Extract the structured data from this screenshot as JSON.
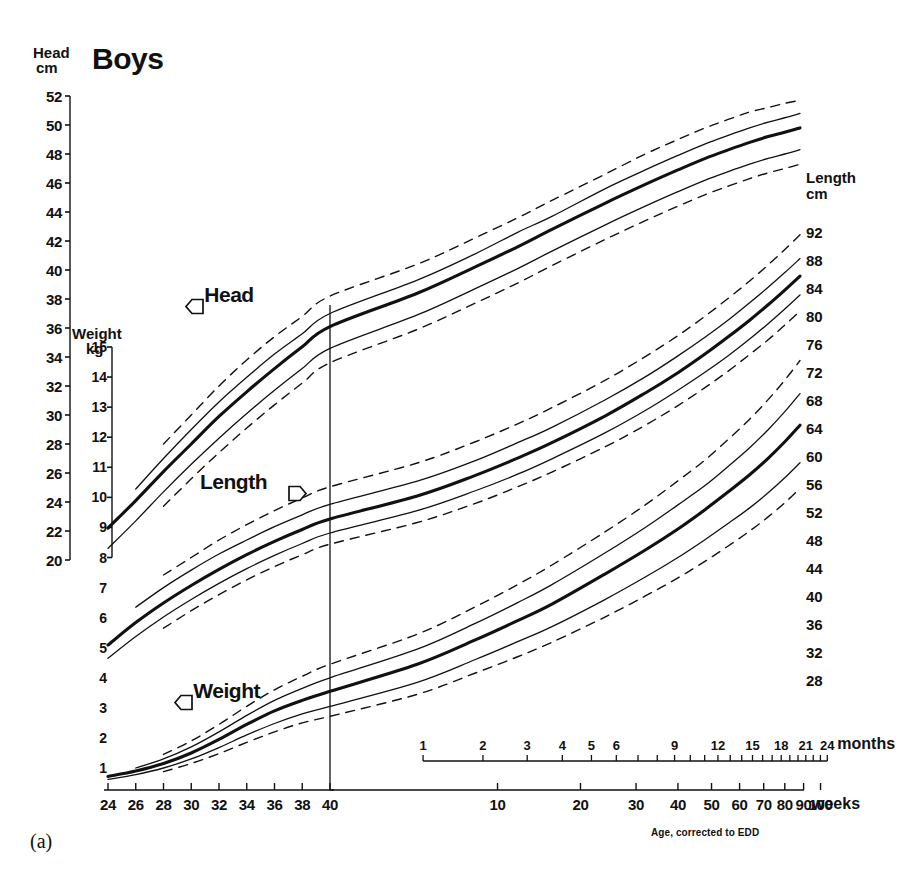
{
  "title": "Boys",
  "figure_caption": "(a)",
  "footnote": "Age, corrected to EDD",
  "axes": {
    "head": {
      "caption_line1": "Head",
      "caption_line2": "cm",
      "ticks": [
        52,
        50,
        48,
        46,
        44,
        42,
        40,
        38,
        36,
        34,
        32,
        30,
        28,
        26,
        24,
        22,
        20
      ]
    },
    "weight": {
      "caption_line1": "Weight",
      "caption_line2": "kg",
      "ticks": [
        15,
        14,
        13,
        12,
        11,
        10,
        9,
        8,
        7,
        6,
        5,
        4,
        3,
        2,
        1
      ]
    },
    "length": {
      "caption_line1": "Length",
      "caption_line2": "cm",
      "ticks": [
        92,
        88,
        84,
        80,
        76,
        72,
        68,
        64,
        60,
        56,
        52,
        48,
        44,
        40,
        36,
        32,
        28
      ]
    },
    "weeks": {
      "unit": "weeks",
      "pre_term": [
        24,
        26,
        28,
        30,
        32,
        34,
        36,
        38,
        40
      ],
      "post_term": [
        10,
        20,
        30,
        40,
        50,
        60,
        70,
        80,
        90,
        100
      ]
    },
    "months": {
      "unit": "months",
      "labeled": [
        1,
        2,
        3,
        4,
        5,
        6,
        9,
        12,
        15,
        18,
        21,
        24
      ]
    }
  },
  "curve_labels": {
    "head": "Head",
    "length": "Length",
    "weight": "Weight"
  },
  "colors": {
    "ink": "#111111",
    "paper": "#ffffff"
  },
  "chart_data": {
    "type": "line",
    "title": "Boys",
    "xlabel": "Age, corrected to EDD",
    "ylabel": "Head cm / Weight kg / Length cm",
    "grid": false,
    "legend": "inline-labels",
    "x_weeks_preterm": [
      24,
      26,
      28,
      30,
      32,
      34,
      36,
      38,
      40
    ],
    "x_weeks_postterm": [
      10,
      20,
      30,
      40,
      50,
      60,
      70,
      80,
      90,
      100
    ],
    "x_months": [
      1,
      2,
      3,
      4,
      5,
      6,
      9,
      12,
      15,
      18,
      21,
      24
    ],
    "edd_marker_weeks": 40,
    "series": [
      {
        "name": "Head circumference 97th centile",
        "unit": "cm",
        "style": "dashed",
        "x_weeks": [
          28,
          30,
          32,
          34,
          36,
          38,
          40,
          44,
          48,
          52,
          56,
          64,
          72,
          80,
          88,
          96,
          104,
          112,
          120,
          128
        ],
        "values": [
          28.0,
          30.0,
          32.0,
          33.8,
          35.4,
          36.8,
          38.2,
          40.4,
          42.2,
          43.6,
          44.8,
          46.6,
          48.0,
          49.0,
          49.8,
          50.4,
          50.9,
          51.2,
          51.5,
          51.7
        ]
      },
      {
        "name": "Head circumference 90th centile",
        "unit": "cm",
        "style": "thin-solid",
        "x_weeks": [
          26,
          28,
          30,
          32,
          34,
          36,
          38,
          40,
          44,
          48,
          52,
          56,
          64,
          72,
          80,
          88,
          96,
          104,
          112,
          120,
          128
        ],
        "values": [
          24.9,
          27.0,
          29.0,
          30.9,
          32.6,
          34.2,
          35.6,
          37.0,
          39.3,
          41.1,
          42.6,
          43.7,
          45.6,
          46.9,
          47.9,
          48.7,
          49.3,
          49.8,
          50.2,
          50.5,
          50.8
        ]
      },
      {
        "name": "Head circumference 50th centile",
        "unit": "cm",
        "style": "thick-solid",
        "x_weeks": [
          24,
          26,
          28,
          30,
          32,
          34,
          36,
          38,
          40,
          44,
          48,
          52,
          56,
          64,
          72,
          80,
          88,
          96,
          104,
          112,
          120,
          128
        ],
        "values": [
          22.2,
          24.1,
          26.1,
          28.0,
          29.9,
          31.6,
          33.2,
          34.7,
          36.1,
          38.4,
          40.2,
          41.6,
          42.8,
          44.6,
          45.9,
          46.9,
          47.7,
          48.3,
          48.8,
          49.2,
          49.5,
          49.8
        ]
      },
      {
        "name": "Head circumference 10th centile",
        "unit": "cm",
        "style": "thin-solid",
        "x_weeks": [
          24,
          26,
          28,
          30,
          32,
          34,
          36,
          38,
          40,
          44,
          48,
          52,
          56,
          64,
          72,
          80,
          88,
          96,
          104,
          112,
          120,
          128
        ],
        "values": [
          20.8,
          22.7,
          24.7,
          26.6,
          28.4,
          30.1,
          31.7,
          33.2,
          34.6,
          36.9,
          38.7,
          40.1,
          41.3,
          43.1,
          44.4,
          45.4,
          46.2,
          46.8,
          47.3,
          47.7,
          48.0,
          48.3
        ]
      },
      {
        "name": "Head circumference 3rd centile",
        "unit": "cm",
        "style": "dashed",
        "x_weeks": [
          28,
          30,
          32,
          34,
          36,
          38,
          40,
          44,
          48,
          52,
          56,
          64,
          72,
          80,
          88,
          96,
          104,
          112,
          120,
          128
        ],
        "values": [
          23.7,
          25.6,
          27.4,
          29.1,
          30.7,
          32.2,
          33.6,
          35.9,
          37.7,
          39.1,
          40.3,
          42.1,
          43.4,
          44.4,
          45.2,
          45.8,
          46.3,
          46.7,
          47.0,
          47.3
        ]
      },
      {
        "name": "Length 97th centile",
        "unit": "cm",
        "style": "dashed",
        "x_weeks": [
          28,
          30,
          32,
          34,
          36,
          38,
          40,
          44,
          48,
          52,
          56,
          64,
          72,
          80,
          88,
          96,
          104,
          112,
          120,
          128
        ],
        "values": [
          43.0,
          45.5,
          48.0,
          50.2,
          52.2,
          54.0,
          55.6,
          59.0,
          62.0,
          64.6,
          66.9,
          70.8,
          74.2,
          77.2,
          80.0,
          82.6,
          85.0,
          87.3,
          89.5,
          91.6
        ]
      },
      {
        "name": "Length 90th centile",
        "unit": "cm",
        "style": "thin-solid",
        "x_weeks": [
          26,
          28,
          30,
          32,
          34,
          36,
          38,
          40,
          44,
          48,
          52,
          56,
          64,
          72,
          80,
          88,
          96,
          104,
          112,
          120,
          128
        ],
        "values": [
          38.4,
          41.2,
          43.7,
          46.0,
          48.0,
          49.9,
          51.6,
          53.1,
          56.4,
          59.3,
          61.9,
          64.1,
          68.0,
          71.3,
          74.3,
          77.0,
          79.5,
          81.9,
          84.1,
          86.2,
          88.2
        ]
      },
      {
        "name": "Length 50th centile",
        "unit": "cm",
        "style": "thick-solid",
        "x_weeks": [
          24,
          26,
          28,
          30,
          32,
          34,
          36,
          38,
          40,
          44,
          48,
          52,
          56,
          64,
          72,
          80,
          88,
          96,
          104,
          112,
          120,
          128
        ],
        "values": [
          33.0,
          36.2,
          39.0,
          41.5,
          43.8,
          45.9,
          47.8,
          49.5,
          51.0,
          54.3,
          57.2,
          59.7,
          61.9,
          65.7,
          69.0,
          71.9,
          74.6,
          77.1,
          79.4,
          81.6,
          83.7,
          85.7
        ]
      },
      {
        "name": "Length 10th centile",
        "unit": "cm",
        "style": "thin-solid",
        "x_weeks": [
          24,
          26,
          28,
          30,
          32,
          34,
          36,
          38,
          40,
          44,
          48,
          52,
          56,
          64,
          72,
          80,
          88,
          96,
          104,
          112,
          120,
          128
        ],
        "values": [
          31.1,
          34.2,
          37.0,
          39.5,
          41.8,
          43.9,
          45.8,
          47.5,
          49.0,
          52.2,
          55.0,
          57.4,
          59.6,
          63.3,
          66.5,
          69.4,
          72.0,
          74.4,
          76.7,
          78.9,
          81.0,
          83.0
        ]
      },
      {
        "name": "Length 3rd centile",
        "unit": "cm",
        "style": "dashed",
        "x_weeks": [
          28,
          30,
          32,
          34,
          36,
          38,
          40,
          44,
          48,
          52,
          56,
          64,
          72,
          80,
          88,
          96,
          104,
          112,
          120,
          128
        ],
        "values": [
          35.4,
          37.9,
          40.2,
          42.3,
          44.2,
          45.9,
          47.4,
          50.5,
          53.2,
          55.6,
          57.7,
          61.3,
          64.4,
          67.2,
          69.8,
          72.2,
          74.5,
          76.6,
          78.7,
          80.7
        ]
      },
      {
        "name": "Weight 97th centile",
        "unit": "kg",
        "style": "dashed",
        "x_weeks": [
          28,
          30,
          32,
          34,
          36,
          38,
          40,
          44,
          48,
          52,
          56,
          64,
          72,
          80,
          88,
          96,
          104,
          112,
          120,
          128
        ],
        "values": [
          1.45,
          1.9,
          2.45,
          3.05,
          3.6,
          4.05,
          4.45,
          5.45,
          6.35,
          7.1,
          7.75,
          8.85,
          9.75,
          10.55,
          11.25,
          11.95,
          12.6,
          13.25,
          13.9,
          14.55
        ]
      },
      {
        "name": "Weight 90th centile",
        "unit": "kg",
        "style": "thin-solid",
        "x_weeks": [
          26,
          28,
          30,
          32,
          34,
          36,
          38,
          40,
          44,
          48,
          52,
          56,
          64,
          72,
          80,
          88,
          96,
          104,
          112,
          120,
          128
        ],
        "values": [
          1.0,
          1.3,
          1.7,
          2.2,
          2.75,
          3.25,
          3.65,
          4.0,
          4.95,
          5.8,
          6.5,
          7.1,
          8.15,
          9.0,
          9.75,
          10.4,
          11.05,
          11.65,
          12.25,
          12.85,
          13.45
        ]
      },
      {
        "name": "Weight 50th centile",
        "unit": "kg",
        "style": "thick-solid",
        "x_weeks": [
          24,
          26,
          28,
          30,
          32,
          34,
          36,
          38,
          40,
          44,
          48,
          52,
          56,
          64,
          72,
          80,
          88,
          96,
          104,
          112,
          120,
          128
        ],
        "values": [
          0.72,
          0.9,
          1.15,
          1.5,
          1.95,
          2.45,
          2.9,
          3.25,
          3.55,
          4.45,
          5.25,
          5.9,
          6.45,
          7.45,
          8.25,
          8.95,
          9.6,
          10.2,
          10.75,
          11.3,
          11.85,
          12.4
        ]
      },
      {
        "name": "Weight 10th centile",
        "unit": "kg",
        "style": "thin-solid",
        "x_weeks": [
          24,
          26,
          28,
          30,
          32,
          34,
          36,
          38,
          40,
          44,
          48,
          52,
          56,
          64,
          72,
          80,
          88,
          96,
          104,
          112,
          120,
          128
        ],
        "values": [
          0.62,
          0.78,
          1.0,
          1.3,
          1.68,
          2.1,
          2.48,
          2.8,
          3.05,
          3.85,
          4.6,
          5.2,
          5.7,
          6.6,
          7.35,
          8.0,
          8.6,
          9.15,
          9.65,
          10.15,
          10.65,
          11.15
        ]
      },
      {
        "name": "Weight 3rd centile",
        "unit": "kg",
        "style": "dashed",
        "x_weeks": [
          28,
          30,
          32,
          34,
          36,
          38,
          40,
          44,
          48,
          52,
          56,
          64,
          72,
          80,
          88,
          96,
          104,
          112,
          120,
          128
        ],
        "values": [
          0.88,
          1.15,
          1.48,
          1.85,
          2.2,
          2.5,
          2.72,
          3.45,
          4.15,
          4.7,
          5.18,
          6.02,
          6.72,
          7.32,
          7.88,
          8.4,
          8.88,
          9.35,
          9.82,
          10.3
        ]
      }
    ]
  }
}
